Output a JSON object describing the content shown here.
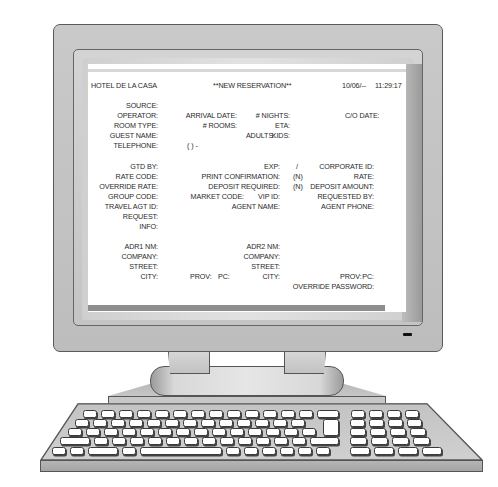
{
  "screen": {
    "header": {
      "hotel_name": "HOTEL DE LA CASA",
      "title": "**NEW RESERVATION**",
      "date": "10/06/--",
      "time": "11:29:17"
    },
    "section1": {
      "source": "SOURCE:",
      "operator": "OPERATOR:",
      "room_type": "ROOM TYPE:",
      "guest_name": "GUEST NAME:",
      "telephone": "TELEPHONE:",
      "telephone_value": "(   )   -",
      "arrival_date": "ARRIVAL DATE:",
      "rooms": "# ROOMS:",
      "nights": "# NIGHTS:",
      "eta": "ETA:",
      "adults": "ADULTS:",
      "kids": "KIDS:",
      "co_date": "C/O DATE:"
    },
    "section2": {
      "gtd_by": "GTD BY:",
      "rate_code": "RATE CODE:",
      "override_rate": "OVERRIDE RATE:",
      "group_code": "GROUP CODE:",
      "travel_agt_id": "TRAVEL AGT ID:",
      "request": "REQUEST:",
      "info": "INFO:",
      "exp": "EXP:",
      "exp_value": "/",
      "print_confirmation": "PRINT CONFIRMATION:",
      "print_confirmation_value": "(N)",
      "deposit_required": "DEPOSIT REQUIRED:",
      "deposit_required_value": "(N)",
      "market_code": "MARKET CODE:",
      "vip_id": "VIP ID:",
      "agent_name": "AGENT NAME:",
      "corporate_id": "CORPORATE ID:",
      "rate": "RATE:",
      "deposit_amount": "DEPOSIT AMOUNT:",
      "requested_by": "REQUESTED BY:",
      "agent_phone": "AGENT PHONE:"
    },
    "section3": {
      "adr1_nm": "ADR1 NM:",
      "company1": "COMPANY:",
      "street1": "STREET:",
      "city1": "CITY:",
      "prov1": "PROV:",
      "pc1": "PC:",
      "adr2_nm": "ADR2 NM:",
      "company2": "COMPANY:",
      "street2": "STREET:",
      "city2": "CITY:",
      "prov2": "PROV:",
      "pc2": "PC:",
      "override_password": "OVERRIDE PASSWORD:"
    }
  },
  "colors": {
    "monitor_body": "#c4c4c4",
    "screen_bg": "#ffffff",
    "text": "#2a2a2a",
    "status_bar": "#8e8e8e"
  }
}
